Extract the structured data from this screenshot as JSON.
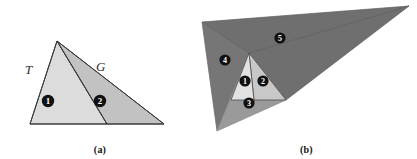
{
  "figure": {
    "panels": [
      {
        "id": "a",
        "caption": "(a)",
        "edge_labels": [
          {
            "name": "T",
            "text": "T"
          },
          {
            "name": "G",
            "text": "G"
          }
        ],
        "regions": [
          {
            "marker": "1",
            "fill": "#dcdcdc",
            "label": "region-one"
          },
          {
            "marker": "2",
            "fill": "#c2c2c2",
            "label": "region-two"
          }
        ]
      },
      {
        "id": "b",
        "caption": "(b)",
        "regions": [
          {
            "marker": "1",
            "fill": "#e2e2e2",
            "label": "region-one"
          },
          {
            "marker": "2",
            "fill": "#c8c8c8",
            "label": "region-two"
          },
          {
            "marker": "3",
            "fill": "#9a9a9a",
            "label": "region-three"
          },
          {
            "marker": "4",
            "fill": "#767676",
            "label": "region-four"
          },
          {
            "marker": "5",
            "fill": "#6f6f6f",
            "label": "region-five"
          }
        ]
      }
    ],
    "colors": {
      "outline": "#3a3a3a",
      "marker_fill": "#111111",
      "marker_text": "#ffffff",
      "background": "#ffffff"
    }
  }
}
